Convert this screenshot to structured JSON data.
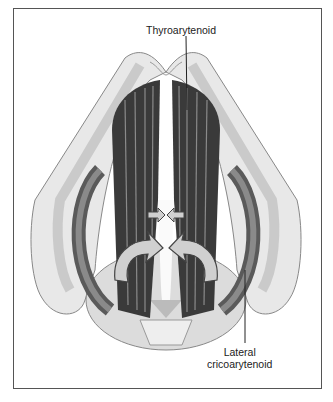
{
  "diagram": {
    "labels": {
      "top": "Thyroarytenoid",
      "bottom_line1": "Lateral",
      "bottom_line2": "cricoarytenoid"
    },
    "colors": {
      "frame": "#555555",
      "cartilage_light": "#e6e6e6",
      "cartilage_mid": "#bdbdbd",
      "muscle_dark": "#3a3a3a",
      "muscle_mid": "#6e6e6e",
      "arrow_fill": "#d0d0d0",
      "arrow_stroke": "#444444"
    }
  }
}
